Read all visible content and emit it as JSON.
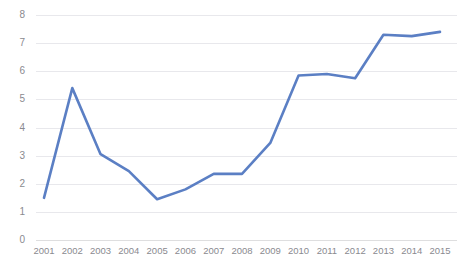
{
  "chart_data": {
    "type": "line",
    "title": "",
    "subtitle": "",
    "xlabel": "",
    "ylabel": "",
    "categories": [
      "2001",
      "2002",
      "2003",
      "2004",
      "2005",
      "2006",
      "2007",
      "2008",
      "2009",
      "2010",
      "2011",
      "2012",
      "2013",
      "2014",
      "2015"
    ],
    "series": [
      {
        "name": "series-1",
        "color": "#5b7fc4",
        "values": [
          1.5,
          5.4,
          3.05,
          2.45,
          1.45,
          1.8,
          2.35,
          2.35,
          3.45,
          5.85,
          5.9,
          5.75,
          7.3,
          7.25,
          7.4
        ]
      }
    ],
    "ylim": [
      0,
      8
    ],
    "y_ticks": [
      0,
      1,
      2,
      3,
      4,
      5,
      6,
      7,
      8
    ],
    "y_tick_labels": [
      "0",
      "1",
      "2",
      "3",
      "4",
      "5",
      "6",
      "7",
      "8"
    ],
    "grid": true,
    "grid_color": "#e8e8ec",
    "legend": false,
    "legend_position": "none",
    "markers": false,
    "line_width": 2.6,
    "background": "#ffffff",
    "tick_label_color": "#8a8a8f"
  }
}
